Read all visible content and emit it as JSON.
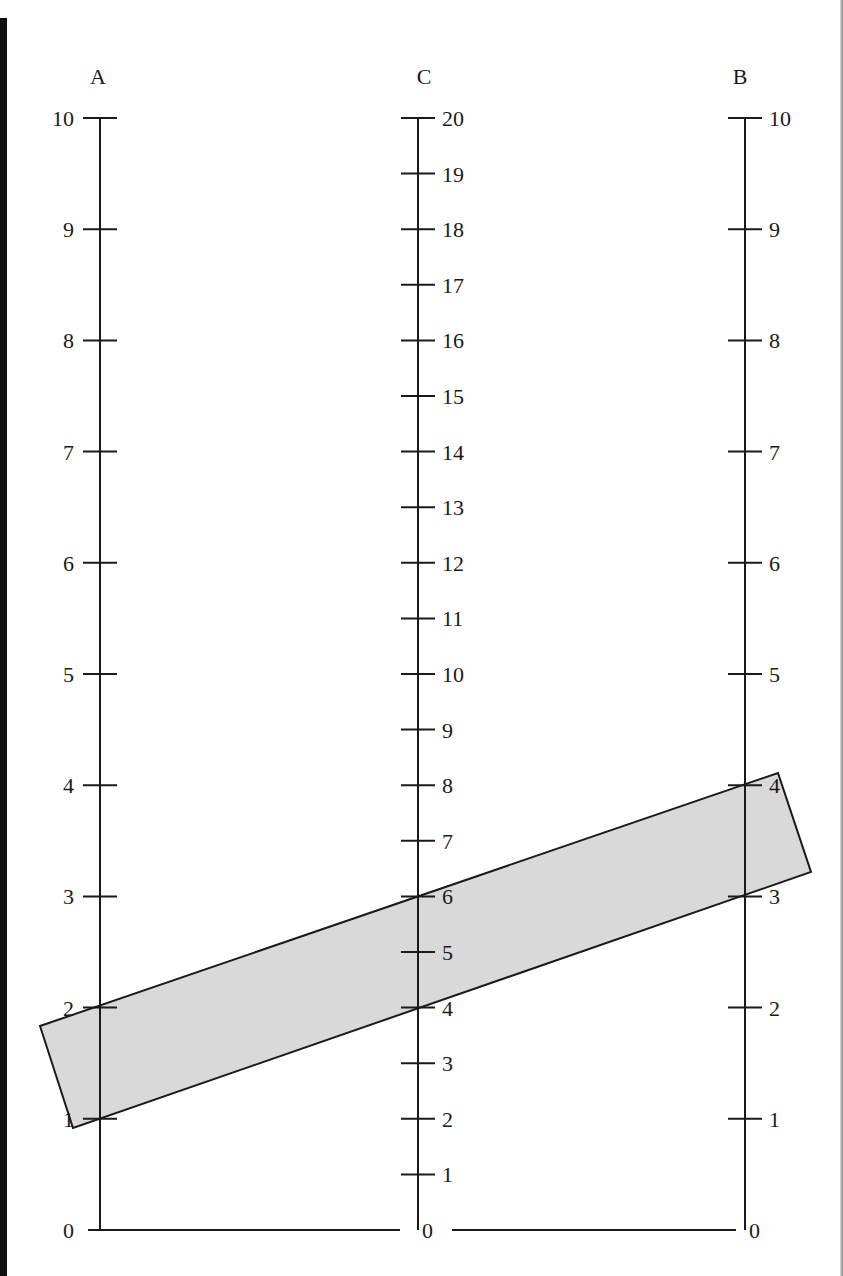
{
  "axes": {
    "A": {
      "label": "A",
      "min": 0,
      "max": 10,
      "ticks": [
        "0",
        "1",
        "2",
        "3",
        "4",
        "5",
        "6",
        "7",
        "8",
        "9",
        "10"
      ],
      "label_side": "left"
    },
    "C": {
      "label": "C",
      "min": 0,
      "max": 20,
      "ticks": [
        "0",
        "1",
        "2",
        "3",
        "4",
        "5",
        "6",
        "7",
        "8",
        "9",
        "10",
        "11",
        "12",
        "13",
        "14",
        "15",
        "16",
        "17",
        "18",
        "19",
        "20"
      ],
      "label_side": "right"
    },
    "B": {
      "label": "B",
      "min": 0,
      "max": 10,
      "ticks": [
        "0",
        "1",
        "2",
        "3",
        "4",
        "5",
        "6",
        "7",
        "8",
        "9",
        "10"
      ],
      "label_side": "right"
    }
  },
  "band": {
    "description": "Shaded straightedge strip connecting A and B scales",
    "fill": "#d9d9d9",
    "top_line": {
      "A": 2,
      "C": 6,
      "B": 4
    },
    "bottom_line": {
      "A": 1,
      "C": 4,
      "B": 3
    }
  },
  "colors": {
    "ink": "#1a1a1a",
    "band_fill": "#d9d9d9",
    "background": "#ffffff"
  }
}
